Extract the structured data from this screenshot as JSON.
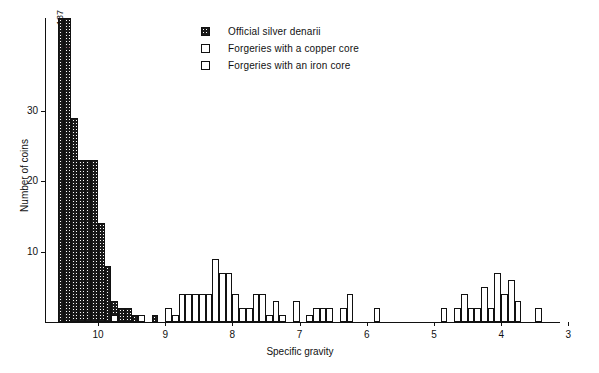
{
  "chart_data": {
    "type": "bar",
    "title": "",
    "subtitle": "",
    "xlabel": "Specific gravity",
    "ylabel": "Number of coins",
    "grid": false,
    "legend_position": "top-center",
    "xlim": [
      10.65,
      3.0
    ],
    "x_axis_reversed": true,
    "ylim": [
      0,
      40
    ],
    "y_clipped_at": 40,
    "bin_width": 0.1,
    "xticks": [
      10,
      9,
      8,
      7,
      6,
      5,
      4,
      3
    ],
    "xtick_labels": [
      "10",
      "9",
      "8",
      "7",
      "6",
      "5",
      "4",
      "3"
    ],
    "yticks": [
      10,
      20,
      30
    ],
    "ytick_labels": [
      "10",
      "20",
      "30"
    ],
    "data_labels": [
      {
        "x": 10.55,
        "value": 137,
        "text": "137"
      },
      {
        "x": 10.45,
        "value": 75,
        "text": "75"
      }
    ],
    "series": [
      {
        "name": "Official silver denarii",
        "fill": "stipple",
        "color": "#1a1a1a",
        "bins": [
          {
            "x": 10.55,
            "count": 137
          },
          {
            "x": 10.45,
            "count": 75
          },
          {
            "x": 10.35,
            "count": 29
          },
          {
            "x": 10.25,
            "count": 23
          },
          {
            "x": 10.15,
            "count": 23
          },
          {
            "x": 10.05,
            "count": 23
          },
          {
            "x": 9.95,
            "count": 14
          },
          {
            "x": 9.85,
            "count": 8
          },
          {
            "x": 9.75,
            "count": 3
          },
          {
            "x": 9.65,
            "count": 2
          },
          {
            "x": 9.55,
            "count": 2
          },
          {
            "x": 9.45,
            "count": 1
          },
          {
            "x": 9.15,
            "count": 1
          }
        ]
      },
      {
        "name": "Forgeries with a copper core",
        "fill": "open",
        "color": "#ffffff",
        "bins": [
          {
            "x": 9.75,
            "count": 1
          },
          {
            "x": 9.35,
            "count": 1
          },
          {
            "x": 8.95,
            "count": 2
          },
          {
            "x": 8.85,
            "count": 1
          },
          {
            "x": 8.75,
            "count": 4
          },
          {
            "x": 8.65,
            "count": 4
          },
          {
            "x": 8.55,
            "count": 4
          },
          {
            "x": 8.45,
            "count": 4
          },
          {
            "x": 8.35,
            "count": 4
          },
          {
            "x": 8.25,
            "count": 9
          },
          {
            "x": 8.15,
            "count": 7
          },
          {
            "x": 8.05,
            "count": 7
          },
          {
            "x": 7.95,
            "count": 4
          },
          {
            "x": 7.85,
            "count": 2
          },
          {
            "x": 7.75,
            "count": 2
          },
          {
            "x": 7.65,
            "count": 4
          },
          {
            "x": 7.55,
            "count": 4
          },
          {
            "x": 7.45,
            "count": 1
          },
          {
            "x": 7.35,
            "count": 3
          },
          {
            "x": 7.25,
            "count": 1
          },
          {
            "x": 7.05,
            "count": 3
          },
          {
            "x": 6.85,
            "count": 1
          },
          {
            "x": 6.75,
            "count": 2
          },
          {
            "x": 6.65,
            "count": 2
          },
          {
            "x": 6.55,
            "count": 2
          },
          {
            "x": 6.35,
            "count": 2
          },
          {
            "x": 6.25,
            "count": 4
          },
          {
            "x": 5.85,
            "count": 2
          }
        ]
      },
      {
        "name": "Forgeries with an iron core",
        "fill": "open",
        "color": "#ffffff",
        "bins": [
          {
            "x": 4.85,
            "count": 2
          },
          {
            "x": 4.65,
            "count": 2
          },
          {
            "x": 4.55,
            "count": 4
          },
          {
            "x": 4.45,
            "count": 2
          },
          {
            "x": 4.35,
            "count": 2
          },
          {
            "x": 4.25,
            "count": 5
          },
          {
            "x": 4.15,
            "count": 2
          },
          {
            "x": 4.05,
            "count": 7
          },
          {
            "x": 3.95,
            "count": 4
          },
          {
            "x": 3.85,
            "count": 6
          },
          {
            "x": 3.75,
            "count": 3
          },
          {
            "x": 3.45,
            "count": 2
          }
        ]
      }
    ]
  },
  "legend": {
    "items": [
      {
        "label": "Official silver denarii",
        "swatch": "stipple-square-icon"
      },
      {
        "label": "Forgeries with a copper core",
        "swatch": "open-square-icon"
      },
      {
        "label": "Forgeries with an iron core",
        "swatch": "open-square-icon"
      }
    ]
  }
}
